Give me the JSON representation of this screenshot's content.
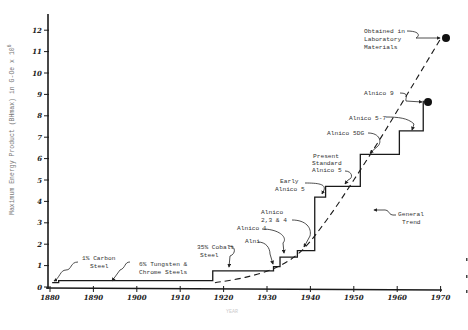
{
  "chart_data": {
    "type": "line",
    "title": "",
    "xlabel": "Year",
    "ylabel": "Maximum Energy Product (BHmax) in G-Oe x 10^6",
    "xlim": [
      1880,
      1970
    ],
    "ylim": [
      0,
      12
    ],
    "x_ticks": [
      "1880",
      "1890",
      "1900",
      "1910",
      "1920",
      "1930",
      "1940",
      "1950",
      "1960",
      "1970"
    ],
    "y_ticks": [
      "0",
      "1",
      "2",
      "3",
      "4",
      "5",
      "6",
      "7",
      "8",
      "9",
      "10",
      "11",
      "12"
    ],
    "grid": false,
    "series": [
      {
        "name": "Commercial magnet materials (step)",
        "style": "solid-step",
        "points": [
          {
            "x": 1880.5,
            "y": 0.2
          },
          {
            "x": 1882,
            "y": 0.3
          },
          {
            "x": 1917.5,
            "y": 0.75
          },
          {
            "x": 1931.5,
            "y": 0.95
          },
          {
            "x": 1933,
            "y": 1.4
          },
          {
            "x": 1937,
            "y": 1.7
          },
          {
            "x": 1941,
            "y": 4.2
          },
          {
            "x": 1943.5,
            "y": 4.7
          },
          {
            "x": 1951.5,
            "y": 6.2
          },
          {
            "x": 1960.5,
            "y": 7.3
          },
          {
            "x": 1966,
            "y": 8.7
          }
        ],
        "end_x": 1966
      },
      {
        "name": "General Trend",
        "style": "dashed",
        "points": [
          {
            "x": 1918,
            "y": 0.2
          },
          {
            "x": 1925,
            "y": 0.45
          },
          {
            "x": 1932,
            "y": 0.9
          },
          {
            "x": 1938,
            "y": 1.7
          },
          {
            "x": 1944,
            "y": 3.2
          },
          {
            "x": 1950,
            "y": 5.0
          },
          {
            "x": 1956,
            "y": 6.9
          },
          {
            "x": 1962,
            "y": 8.9
          },
          {
            "x": 1970,
            "y": 11.6
          }
        ]
      }
    ],
    "markers": [
      {
        "label": "Alnico 9",
        "x": 1966,
        "y": 8.7
      },
      {
        "label": "Obtained in Laboratory Materials",
        "x": 1970,
        "y": 11.6
      }
    ],
    "annotations": [
      {
        "text": [
          "1% Carbon",
          "Steel"
        ],
        "target_year": 1881
      },
      {
        "text": [
          "6% Tungsten &",
          "Chrome Steels"
        ],
        "target_year": 1896
      },
      {
        "text": [
          "35% Cobalt",
          "Steel"
        ],
        "target_year": 1920
      },
      {
        "text": [
          "Alni"
        ],
        "target_year": 1932
      },
      {
        "text": [
          "Alnico 1"
        ],
        "target_year": 1934
      },
      {
        "text": [
          "Alnico",
          "2,3 & 4"
        ],
        "target_year": 1938
      },
      {
        "text": [
          "Early",
          "Alnico 5"
        ],
        "target_year": 1941
      },
      {
        "text": [
          "Present",
          "Standard",
          "Alnico 5"
        ],
        "target_year": 1946
      },
      {
        "text": [
          "Alnico 5DG"
        ],
        "target_year": 1953
      },
      {
        "text": [
          "Alnico 5-7"
        ],
        "target_year": 1962
      },
      {
        "text": [
          "Alnico 9"
        ],
        "target_year": 1966
      },
      {
        "text": [
          "Obtained in",
          "Laboratory",
          "Materials"
        ],
        "target_year": 1970
      },
      {
        "text": [
          "General",
          "Trend"
        ],
        "target_year": 1950
      }
    ]
  },
  "labels": {
    "ylabel": "Maximum Energy Product (BHmax) in G-Oe x 10",
    "ylabel_sup": "6",
    "xlabel": "YEAR",
    "ann_carbon_1": "1% Carbon",
    "ann_carbon_2": "Steel",
    "ann_tungsten_1": "6% Tungsten &",
    "ann_tungsten_2": "Chrome Steels",
    "ann_cobalt_1": "35% Cobalt",
    "ann_cobalt_2": "Steel",
    "ann_alni": "Alni",
    "ann_alnico1": "Alnico 1",
    "ann_alnico234_1": "Alnico",
    "ann_alnico234_2": "2,3 & 4",
    "ann_early5_1": "Early",
    "ann_early5_2": "Alnico 5",
    "ann_present_1": "Present",
    "ann_present_2": "Standard",
    "ann_present_3": "Alnico 5",
    "ann_5dg": "Alnico 5DG",
    "ann_57": "Alnico 5-7",
    "ann_9": "Alnico 9",
    "ann_lab_1": "Obtained in",
    "ann_lab_2": "Laboratory",
    "ann_lab_3": "Materials",
    "ann_trend_1": "General",
    "ann_trend_2": "Trend"
  },
  "colors": {
    "ink": "#1a1a1a",
    "text": "#333333",
    "background": "#ffffff"
  }
}
